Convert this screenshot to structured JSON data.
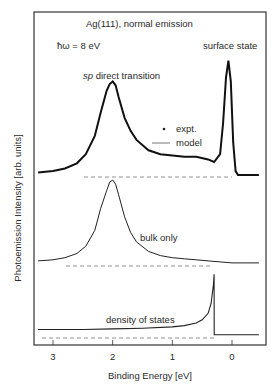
{
  "chart_data": {
    "type": "line",
    "title": "Ag(111), normal emission",
    "annotations": {
      "photon_energy": "ħω = 8 eV",
      "surface_state": "surface state",
      "sp_transition_italic": "sp",
      "sp_transition_rest": " direct transition",
      "bulk_only": "bulk only",
      "density_of_states": "density of states"
    },
    "xlabel": "Binding Energy  [eV]",
    "ylabel": "Photoemission Intensity  [arb. units]",
    "xlim": [
      3.3,
      -0.55
    ],
    "x_reversed": true,
    "x_ticks": [
      3,
      2,
      1,
      0
    ],
    "x_tick_labels": [
      "3",
      "2",
      "1",
      "0"
    ],
    "grid": false,
    "legend": {
      "position": "upper right (middle of top panel)",
      "entries": [
        {
          "label": "expt.",
          "marker": "dot"
        },
        {
          "label": "model",
          "marker": "line"
        }
      ]
    },
    "series": [
      {
        "name": "expt. + model (top panel)",
        "peaks": [
          {
            "binding_energy_eV": 2.0,
            "label": "sp direct transition",
            "relative_height": 0.72
          },
          {
            "binding_energy_eV": 0.06,
            "label": "surface state",
            "relative_height": 0.88
          }
        ],
        "x": [
          3.25,
          3.0,
          2.8,
          2.6,
          2.45,
          2.3,
          2.2,
          2.1,
          2.05,
          2.0,
          1.95,
          1.9,
          1.8,
          1.7,
          1.6,
          1.4,
          1.2,
          1.0,
          0.8,
          0.6,
          0.4,
          0.3,
          0.2,
          0.15,
          0.1,
          0.06,
          0.02,
          -0.02,
          -0.06,
          -0.1,
          -0.2,
          -0.3,
          -0.45
        ],
        "y": [
          0.02,
          0.03,
          0.05,
          0.09,
          0.16,
          0.3,
          0.48,
          0.65,
          0.7,
          0.72,
          0.69,
          0.6,
          0.44,
          0.34,
          0.27,
          0.19,
          0.16,
          0.15,
          0.14,
          0.14,
          0.12,
          0.1,
          0.16,
          0.4,
          0.75,
          0.88,
          0.72,
          0.25,
          0.03,
          0.0,
          0.0,
          0.0,
          0.0
        ]
      },
      {
        "name": "bulk only (middle panel)",
        "x": [
          3.25,
          3.0,
          2.8,
          2.6,
          2.45,
          2.3,
          2.2,
          2.1,
          2.05,
          2.0,
          1.95,
          1.9,
          1.8,
          1.7,
          1.6,
          1.4,
          1.2,
          1.0,
          0.8,
          0.6,
          0.4,
          0.2,
          0.0,
          -0.2,
          -0.45
        ],
        "y": [
          0.03,
          0.04,
          0.06,
          0.1,
          0.17,
          0.32,
          0.53,
          0.7,
          0.78,
          0.8,
          0.76,
          0.66,
          0.45,
          0.3,
          0.21,
          0.12,
          0.08,
          0.06,
          0.05,
          0.04,
          0.03,
          0.02,
          0.01,
          0.01,
          0.01
        ]
      },
      {
        "name": "density of states (bottom panel)",
        "x": [
          3.25,
          3.0,
          2.5,
          2.0,
          1.5,
          1.0,
          0.8,
          0.6,
          0.5,
          0.4,
          0.35,
          0.31,
          0.3,
          0.299,
          0.2,
          0.0,
          -0.2,
          -0.45
        ],
        "y": [
          0.1,
          0.1,
          0.1,
          0.11,
          0.12,
          0.14,
          0.16,
          0.2,
          0.25,
          0.35,
          0.5,
          0.8,
          0.95,
          0.02,
          0.02,
          0.02,
          0.02,
          0.02
        ]
      }
    ]
  }
}
